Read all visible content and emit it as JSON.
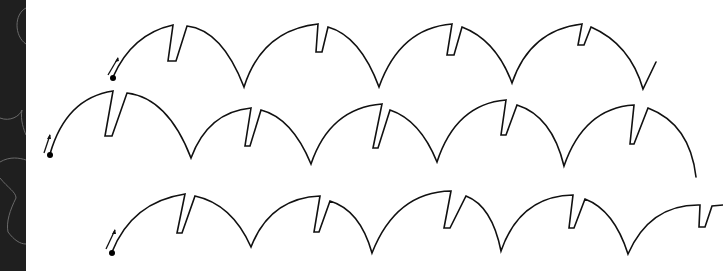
{
  "figure": {
    "colors": {
      "background": "#ffffff",
      "stroke": "#111111",
      "side_strip": "#1f1f1f",
      "side_strip_decoration": "#6a6a6a"
    },
    "rows": [
      {
        "id": "row-1",
        "start_point": [
          113,
          78
        ],
        "direction_arrow": "up-right",
        "arc_count": 4
      },
      {
        "id": "row-2",
        "start_point": [
          50,
          155
        ],
        "direction_arrow": "up-right",
        "arc_count": 5
      },
      {
        "id": "row-3",
        "start_point": [
          112,
          253
        ],
        "direction_arrow": "up-right",
        "arc_count": 5
      }
    ]
  }
}
